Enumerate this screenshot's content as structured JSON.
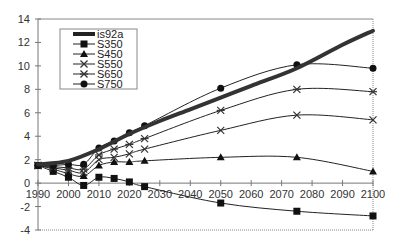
{
  "chart_data": {
    "type": "line",
    "title": "",
    "xlabel": "",
    "ylabel": "",
    "xlim": [
      1990,
      2100
    ],
    "ylim": [
      -4,
      14
    ],
    "grid": false,
    "legend_position": "upper-left-inside",
    "x_ticks": [
      1990,
      2000,
      2010,
      2020,
      2030,
      2040,
      2050,
      2060,
      2070,
      2080,
      2090,
      2100
    ],
    "y_ticks": [
      -4,
      -2,
      0,
      2,
      4,
      6,
      8,
      10,
      12,
      14
    ],
    "series": [
      {
        "name": "is92a",
        "marker": "none",
        "style": "thick",
        "x": [
          1990,
          2000,
          2010,
          2020,
          2030,
          2040,
          2050,
          2060,
          2075,
          2090,
          2100
        ],
        "values": [
          1.6,
          1.9,
          2.9,
          4.2,
          5.3,
          6.3,
          7.3,
          8.3,
          9.8,
          11.8,
          13.0
        ]
      },
      {
        "name": "S350",
        "marker": "square",
        "x": [
          1990,
          1995,
          2000,
          2005,
          2010,
          2015,
          2020,
          2025,
          2050,
          2075,
          2100
        ],
        "values": [
          1.5,
          1.0,
          0.5,
          -0.2,
          0.5,
          0.4,
          0.1,
          -0.3,
          -1.7,
          -2.4,
          -2.8
        ]
      },
      {
        "name": "S450",
        "marker": "triangle",
        "x": [
          1990,
          1995,
          2000,
          2005,
          2010,
          2015,
          2020,
          2025,
          2050,
          2075,
          2100
        ],
        "values": [
          1.5,
          1.2,
          0.8,
          0.6,
          1.5,
          1.8,
          1.8,
          1.9,
          2.2,
          2.2,
          1.0
        ]
      },
      {
        "name": "S550",
        "marker": "x",
        "x": [
          1990,
          1995,
          2000,
          2005,
          2010,
          2015,
          2020,
          2025,
          2050,
          2075,
          2100
        ],
        "values": [
          1.5,
          1.3,
          1.1,
          0.9,
          2.0,
          2.2,
          2.5,
          2.9,
          4.5,
          5.8,
          5.4
        ]
      },
      {
        "name": "S650",
        "marker": "star",
        "x": [
          1990,
          1995,
          2000,
          2005,
          2010,
          2015,
          2020,
          2025,
          2050,
          2075,
          2100
        ],
        "values": [
          1.5,
          1.4,
          1.3,
          1.2,
          2.4,
          2.9,
          3.3,
          3.8,
          6.2,
          8.0,
          7.8
        ]
      },
      {
        "name": "S750",
        "marker": "circle",
        "x": [
          1990,
          1995,
          2000,
          2005,
          2010,
          2015,
          2020,
          2025,
          2050,
          2075,
          2100
        ],
        "values": [
          1.5,
          1.5,
          1.6,
          1.6,
          3.0,
          3.6,
          4.3,
          4.9,
          8.1,
          10.1,
          9.8
        ]
      }
    ]
  },
  "legend": {
    "items": [
      "is92a",
      "S350",
      "S450",
      "S550",
      "S650",
      "S750"
    ]
  }
}
